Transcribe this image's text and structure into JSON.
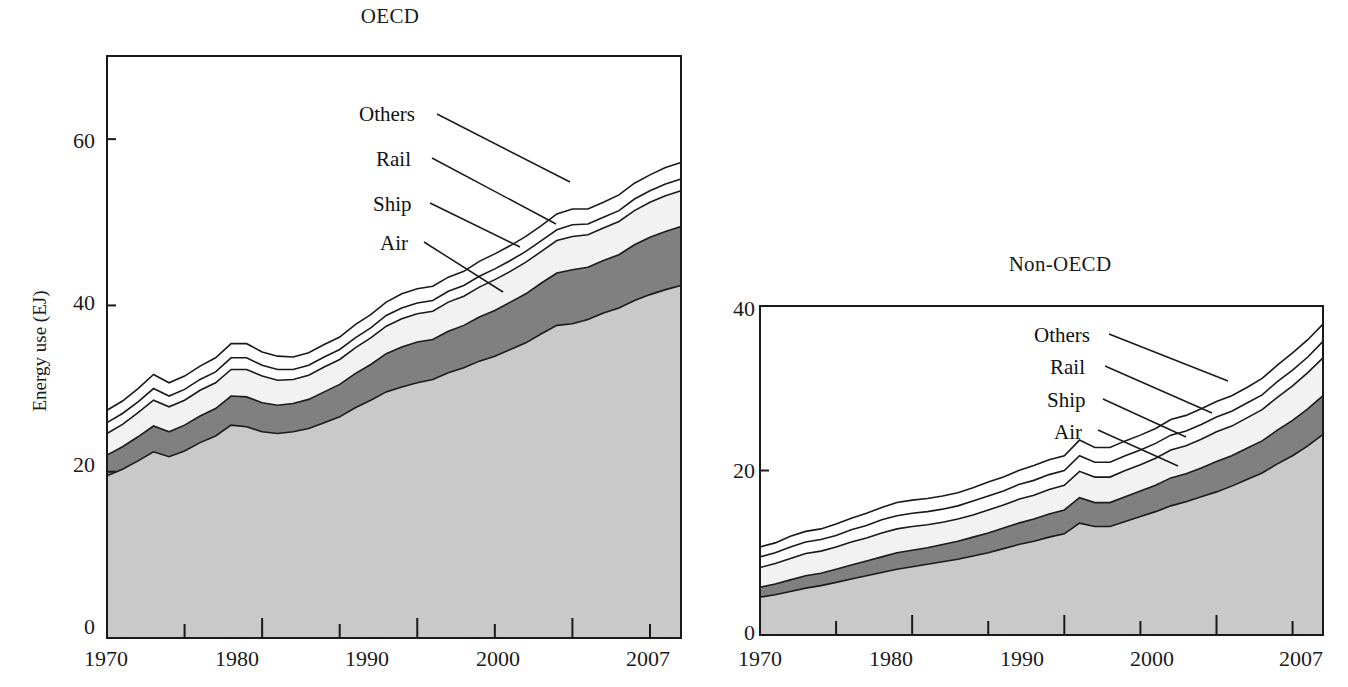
{
  "figure": {
    "ylabel": "Energy use (EJ)"
  },
  "panels": [
    {
      "id": "oecd",
      "title": "OECD",
      "x_ticks_major": [
        "1970",
        "1980",
        "1990",
        "2000",
        "2007"
      ],
      "y_ticks": [
        "0",
        "20",
        "40",
        "60"
      ],
      "series_labels": [
        "Others",
        "Rail",
        "Ship",
        "Air"
      ],
      "area_label": "Road"
    },
    {
      "id": "non-oecd",
      "title": "Non-OECD",
      "x_ticks_major": [
        "1970",
        "1980",
        "1990",
        "2000",
        "2007"
      ],
      "y_ticks": [
        "0",
        "20",
        "40"
      ],
      "series_labels": [
        "Others",
        "Rail",
        "Ship",
        "Air"
      ],
      "area_label": "Road"
    }
  ],
  "colors": {
    "road": "#c9c9c9",
    "air": "#808080",
    "ship": "#f2f2f2",
    "rail": "#ffffff",
    "others": "#ffffff",
    "line": "#1a1a1a",
    "text": "#111111"
  },
  "chart_data": [
    {
      "type": "area",
      "stacked": true,
      "title": "OECD",
      "xlabel": "",
      "ylabel": "Energy use (EJ)",
      "xlim": [
        1970,
        2007
      ],
      "ylim": [
        0,
        70
      ],
      "yticks": [
        0,
        20,
        40,
        60
      ],
      "xticks": [
        1970,
        1980,
        1990,
        2000,
        2007
      ],
      "grid": false,
      "legend": "inline-leader-lines",
      "annotations": [
        "Road",
        "Air",
        "Ship",
        "Rail",
        "Others"
      ],
      "x": [
        1970,
        1971,
        1972,
        1973,
        1974,
        1975,
        1976,
        1977,
        1978,
        1979,
        1980,
        1981,
        1982,
        1983,
        1984,
        1985,
        1986,
        1987,
        1988,
        1989,
        1990,
        1991,
        1992,
        1993,
        1994,
        1995,
        1996,
        1997,
        1998,
        1999,
        2000,
        2001,
        2002,
        2003,
        2004,
        2005,
        2006,
        2007
      ],
      "series": [
        {
          "name": "Road",
          "values": [
            19.5,
            20.3,
            21.3,
            22.4,
            21.8,
            22.5,
            23.5,
            24.3,
            25.6,
            25.4,
            24.8,
            24.6,
            24.8,
            25.2,
            25.9,
            26.6,
            27.7,
            28.6,
            29.6,
            30.2,
            30.7,
            31.1,
            31.9,
            32.5,
            33.3,
            33.9,
            34.7,
            35.5,
            36.6,
            37.6,
            37.8,
            38.3,
            39.1,
            39.7,
            40.6,
            41.3,
            41.9,
            42.4
          ]
        },
        {
          "name": "Air",
          "values": [
            2.5,
            2.7,
            2.9,
            3.1,
            3.0,
            3.1,
            3.2,
            3.3,
            3.5,
            3.6,
            3.5,
            3.4,
            3.4,
            3.5,
            3.7,
            3.9,
            4.1,
            4.3,
            4.6,
            4.8,
            4.9,
            4.8,
            5.0,
            5.1,
            5.3,
            5.5,
            5.7,
            5.9,
            6.1,
            6.3,
            6.5,
            6.3,
            6.3,
            6.4,
            6.7,
            6.9,
            7.0,
            7.1
          ]
        },
        {
          "name": "Ship",
          "values": [
            2.6,
            2.7,
            2.9,
            3.1,
            3.0,
            3.0,
            3.1,
            3.1,
            3.2,
            3.3,
            3.2,
            3.0,
            2.9,
            2.9,
            3.0,
            3.0,
            3.1,
            3.2,
            3.3,
            3.4,
            3.4,
            3.4,
            3.5,
            3.5,
            3.6,
            3.7,
            3.7,
            3.8,
            3.8,
            3.9,
            4.0,
            3.9,
            3.9,
            4.0,
            4.1,
            4.2,
            4.3,
            4.3
          ]
        },
        {
          "name": "Rail",
          "values": [
            1.3,
            1.3,
            1.3,
            1.4,
            1.3,
            1.3,
            1.3,
            1.3,
            1.4,
            1.4,
            1.3,
            1.3,
            1.2,
            1.2,
            1.2,
            1.2,
            1.2,
            1.2,
            1.3,
            1.3,
            1.3,
            1.3,
            1.3,
            1.3,
            1.3,
            1.3,
            1.3,
            1.3,
            1.3,
            1.3,
            1.4,
            1.3,
            1.3,
            1.3,
            1.4,
            1.4,
            1.4,
            1.4
          ]
        },
        {
          "name": "Others",
          "values": [
            1.5,
            1.5,
            1.6,
            1.7,
            1.6,
            1.6,
            1.6,
            1.7,
            1.7,
            1.7,
            1.6,
            1.6,
            1.5,
            1.5,
            1.5,
            1.5,
            1.6,
            1.6,
            1.6,
            1.7,
            1.7,
            1.7,
            1.7,
            1.7,
            1.8,
            1.8,
            1.8,
            1.8,
            1.8,
            1.9,
            1.9,
            1.8,
            1.8,
            1.9,
            1.9,
            1.9,
            2.0,
            2.0
          ]
        }
      ],
      "totals": [
        27.4,
        28.5,
        30.0,
        31.7,
        30.7,
        31.5,
        32.7,
        33.7,
        35.4,
        35.4,
        34.4,
        33.9,
        33.8,
        34.3,
        35.3,
        36.2,
        37.7,
        38.9,
        40.4,
        41.4,
        42.0,
        42.3,
        43.4,
        44.1,
        45.3,
        46.2,
        47.2,
        48.3,
        49.6,
        51.0,
        51.6,
        51.6,
        52.4,
        53.3,
        54.7,
        55.7,
        56.6,
        57.2
      ]
    },
    {
      "type": "area",
      "stacked": true,
      "title": "Non-OECD",
      "xlabel": "",
      "ylabel": "",
      "xlim": [
        1970,
        2007
      ],
      "ylim": [
        0,
        40
      ],
      "yticks": [
        0,
        20,
        40
      ],
      "xticks": [
        1970,
        1980,
        1990,
        2000,
        2007
      ],
      "grid": false,
      "legend": "inline-leader-lines",
      "annotations": [
        "Road",
        "Air",
        "Ship",
        "Rail",
        "Others"
      ],
      "x": [
        1970,
        1971,
        1972,
        1973,
        1974,
        1975,
        1976,
        1977,
        1978,
        1979,
        1980,
        1981,
        1982,
        1983,
        1984,
        1985,
        1986,
        1987,
        1988,
        1989,
        1990,
        1991,
        1992,
        1993,
        1994,
        1995,
        1996,
        1997,
        1998,
        1999,
        2000,
        2001,
        2002,
        2003,
        2004,
        2005,
        2006,
        2007
      ],
      "series": [
        {
          "name": "Road",
          "values": [
            4.6,
            4.9,
            5.3,
            5.7,
            6.0,
            6.4,
            6.8,
            7.2,
            7.6,
            8.0,
            8.3,
            8.6,
            8.9,
            9.2,
            9.6,
            10.0,
            10.5,
            11.0,
            11.4,
            11.9,
            12.3,
            13.6,
            13.2,
            13.2,
            13.8,
            14.4,
            15.0,
            15.7,
            16.2,
            16.8,
            17.4,
            18.1,
            18.9,
            19.7,
            20.8,
            21.8,
            23.0,
            24.4
          ]
        },
        {
          "name": "Air",
          "values": [
            1.2,
            1.3,
            1.4,
            1.5,
            1.5,
            1.6,
            1.7,
            1.8,
            1.9,
            2.0,
            2.0,
            2.0,
            2.1,
            2.2,
            2.3,
            2.4,
            2.5,
            2.6,
            2.7,
            2.8,
            2.9,
            3.1,
            2.9,
            2.9,
            3.0,
            3.1,
            3.2,
            3.4,
            3.4,
            3.5,
            3.7,
            3.7,
            3.8,
            3.9,
            4.1,
            4.3,
            4.5,
            4.7
          ]
        },
        {
          "name": "Ship",
          "values": [
            2.4,
            2.5,
            2.6,
            2.7,
            2.7,
            2.7,
            2.8,
            2.8,
            2.9,
            2.9,
            2.9,
            2.8,
            2.7,
            2.7,
            2.7,
            2.8,
            2.8,
            2.9,
            2.9,
            3.0,
            3.0,
            3.2,
            3.1,
            3.1,
            3.2,
            3.2,
            3.3,
            3.4,
            3.4,
            3.5,
            3.6,
            3.6,
            3.7,
            3.8,
            4.0,
            4.2,
            4.4,
            4.6
          ]
        },
        {
          "name": "Rail",
          "values": [
            1.3,
            1.3,
            1.4,
            1.4,
            1.4,
            1.4,
            1.5,
            1.5,
            1.6,
            1.6,
            1.6,
            1.6,
            1.6,
            1.6,
            1.7,
            1.7,
            1.7,
            1.8,
            1.8,
            1.8,
            1.8,
            1.9,
            1.8,
            1.8,
            1.8,
            1.8,
            1.8,
            1.8,
            1.8,
            1.8,
            1.8,
            1.8,
            1.8,
            1.8,
            1.9,
            1.9,
            1.9,
            2.0
          ]
        },
        {
          "name": "Others",
          "values": [
            1.2,
            1.2,
            1.3,
            1.3,
            1.3,
            1.4,
            1.4,
            1.5,
            1.5,
            1.6,
            1.6,
            1.6,
            1.6,
            1.6,
            1.6,
            1.7,
            1.7,
            1.7,
            1.8,
            1.8,
            1.8,
            1.9,
            1.8,
            1.8,
            1.8,
            1.8,
            1.8,
            1.9,
            1.9,
            1.9,
            1.9,
            1.9,
            1.9,
            2.0,
            2.0,
            2.1,
            2.1,
            2.1
          ]
        }
      ],
      "totals": [
        10.7,
        11.2,
        12.0,
        12.6,
        12.9,
        13.5,
        14.2,
        14.8,
        15.5,
        16.1,
        16.4,
        16.6,
        16.9,
        17.3,
        17.9,
        18.6,
        19.2,
        20.0,
        20.6,
        21.3,
        21.8,
        23.7,
        22.8,
        22.8,
        23.6,
        24.3,
        25.1,
        26.2,
        26.7,
        27.5,
        28.4,
        29.1,
        30.1,
        31.2,
        32.8,
        34.3,
        35.9,
        37.8
      ]
    }
  ]
}
